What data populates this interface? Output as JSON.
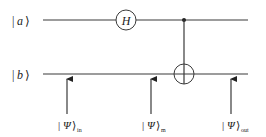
{
  "diagram": {
    "type": "quantum-circuit",
    "qubits": [
      {
        "label": "a",
        "ket_open": "|",
        "ket_close": "⟩"
      },
      {
        "label": "b",
        "ket_open": "|",
        "ket_close": "⟩"
      }
    ],
    "gates": [
      {
        "name": "H",
        "qubit": "a",
        "kind": "hadamard"
      },
      {
        "name": "CNOT",
        "control": "a",
        "target": "b",
        "kind": "controlled-not"
      }
    ],
    "states": [
      {
        "symbol": "Ψ",
        "subscript": "in"
      },
      {
        "symbol": "Ψ",
        "subscript": "m"
      },
      {
        "symbol": "Ψ",
        "subscript": "out"
      }
    ],
    "colors": {
      "line": "#3a3a3a",
      "text": "#222222",
      "background": "#ffffff"
    }
  }
}
